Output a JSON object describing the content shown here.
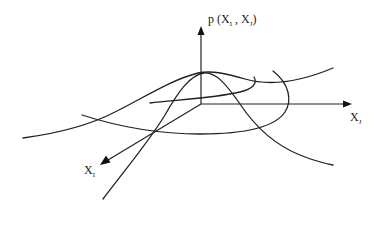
{
  "diagram": {
    "colors": {
      "line": "#222222",
      "background": "#ffffff"
    },
    "axes": {
      "vertical": {
        "label_main": "p (X",
        "label_sub1": "I",
        "label_sep": " , X",
        "label_sub2": "J",
        "label_close": ")"
      },
      "horizontal": {
        "label_main": "X",
        "label_sub": "J"
      },
      "depth": {
        "label_main": "X",
        "label_sub": "I"
      }
    },
    "curves": [
      {
        "name": "cross-section-along-xj",
        "shape": "bell curve through peak, rising left-to-right"
      },
      {
        "name": "cross-section-along-xi",
        "shape": "bell curve through peak, from front-left to back-right"
      },
      {
        "name": "contour-ellipse",
        "shape": "elliptical level-set around the origin"
      }
    ]
  }
}
